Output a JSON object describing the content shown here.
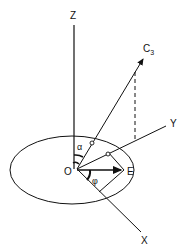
{
  "diagram": {
    "type": "3D coordinate geometry",
    "labels": {
      "z_axis": "Z",
      "y_axis": "Y",
      "x_axis": "X",
      "origin": "O",
      "point_e": "E",
      "vector_c3_main": "C",
      "vector_c3_sub": "3",
      "angle_alpha": "α",
      "angle_phi": "φ"
    },
    "colors": {
      "stroke": "#111111",
      "background": "#ffffff"
    }
  }
}
